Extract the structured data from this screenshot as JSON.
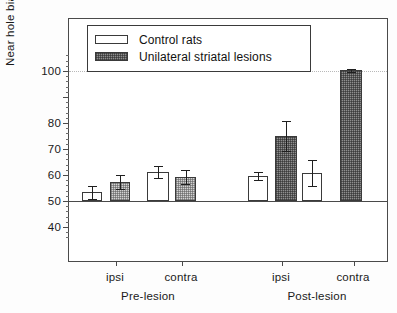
{
  "chart_data": {
    "type": "bar",
    "title": "",
    "xlabel": "",
    "ylabel": "Near hole bias (%)",
    "ylim": [
      35,
      108
    ],
    "yticks": [
      40,
      50,
      60,
      70,
      80,
      90,
      100
    ],
    "ytick_labels": [
      "40",
      "50",
      "60",
      "70",
      "80",
      "90",
      "100"
    ],
    "ytick_labels_visible": [
      "40",
      "50",
      "60",
      "70",
      "80",
      "100"
    ],
    "minor_ticks": true,
    "grid": false,
    "reference_lines": [
      {
        "value": 50,
        "style": "solid",
        "color": "#4a4a4a"
      },
      {
        "value": 100,
        "style": "dotted",
        "color": "#b9b9b9"
      }
    ],
    "categories": [
      "ipsi",
      "contra",
      "ipsi",
      "contra"
    ],
    "groups": [
      "Pre-lesion",
      "Post-lesion"
    ],
    "legend_position": "top-left",
    "series": [
      {
        "name": "Control rats",
        "fill": "white",
        "values": [
          53.3,
          61.2,
          59.6,
          60.6
        ],
        "errors": [
          2.6,
          2.3,
          1.4,
          5.0
        ]
      },
      {
        "name": "Unilateral striatal lesions",
        "fill": "hatched-gray",
        "values": [
          57.4,
          59.4,
          74.9,
          100.2
        ],
        "errors": [
          2.6,
          2.7,
          5.7,
          0.4
        ]
      }
    ]
  },
  "legend": {
    "items": [
      {
        "label": "Control rats",
        "swatch": "control"
      },
      {
        "label": "Unilateral striatal lesions",
        "swatch": "lesion"
      }
    ]
  },
  "axes": {
    "y_title": "Near hole bias (%)",
    "y_labels": [
      {
        "value": 100,
        "text": "100"
      },
      {
        "value": 80,
        "text": "80"
      },
      {
        "value": 70,
        "text": "70"
      },
      {
        "value": 60,
        "text": "60"
      },
      {
        "value": 50,
        "text": "50"
      },
      {
        "value": 40,
        "text": "40"
      }
    ],
    "x_labels": [
      {
        "text": "ipsi"
      },
      {
        "text": "contra"
      },
      {
        "text": "ipsi"
      },
      {
        "text": "contra"
      }
    ],
    "group_labels": [
      {
        "text": "Pre-lesion"
      },
      {
        "text": "Post-lesion"
      }
    ]
  },
  "colors": {
    "axis": "#4a4a4a",
    "bar_outline": "#3a3a3a",
    "control_fill": "#ffffff",
    "lesion_fill": "#8f8f8f",
    "lesion_fill_light": "#d3d3d3",
    "error_bar": "#1f1f1f",
    "refline_100": "#b9b9b9",
    "background": "#ffffff"
  }
}
